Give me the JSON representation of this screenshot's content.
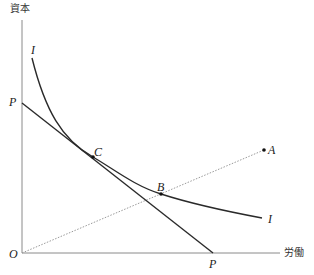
{
  "diagram": {
    "type": "isoquant-isocost",
    "axes": {
      "y_label": "資本",
      "x_label": "労働",
      "origin_label": "O"
    },
    "isocost": {
      "label_y_intercept": "P",
      "label_x_intercept": "P"
    },
    "isoquant": {
      "label_start": "I",
      "label_end": "I"
    },
    "points": [
      {
        "label": "C",
        "note": "tangency of isocost P-P and isoquant I"
      },
      {
        "label": "B",
        "note": "on isoquant I and on ray O-A"
      },
      {
        "label": "A",
        "note": "end of dotted ray from origin"
      }
    ],
    "colors": {
      "line": "#2a2a2a",
      "ray": "#9a9a9a",
      "axis": "#8a8a8a"
    }
  }
}
